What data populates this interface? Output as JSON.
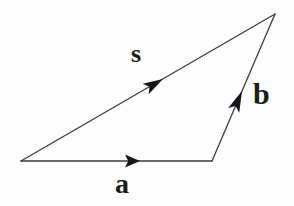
{
  "figure": {
    "kind": "vector-triangle-diagram",
    "background_color": "#fdfdfd",
    "stroke_color": "#3a3a42",
    "label_color": "#1b1b1b",
    "stroke_width": 1.3,
    "canvas": {
      "width": 294,
      "height": 206
    },
    "vertices": {
      "origin": {
        "x": 21,
        "y": 161
      },
      "bottom_right": {
        "x": 212,
        "y": 161
      },
      "apex": {
        "x": 275,
        "y": 14
      }
    },
    "vectors": [
      {
        "name": "a",
        "label": "a",
        "from": {
          "x": 21,
          "y": 161
        },
        "to": {
          "x": 212,
          "y": 161
        },
        "arrow_at": {
          "x": 140,
          "y": 161
        },
        "label_position": {
          "x": 115,
          "y": 170
        }
      },
      {
        "name": "b",
        "label": "b",
        "from": {
          "x": 212,
          "y": 161
        },
        "to": {
          "x": 275,
          "y": 14
        },
        "arrow_at": {
          "x": 242,
          "y": 91
        },
        "label_position": {
          "x": 253,
          "y": 79
        }
      },
      {
        "name": "s",
        "label": "s",
        "from": {
          "x": 21,
          "y": 161
        },
        "to": {
          "x": 275,
          "y": 14
        },
        "arrow_at": {
          "x": 163,
          "y": 79
        },
        "label_position": {
          "x": 131,
          "y": 41
        }
      }
    ]
  }
}
